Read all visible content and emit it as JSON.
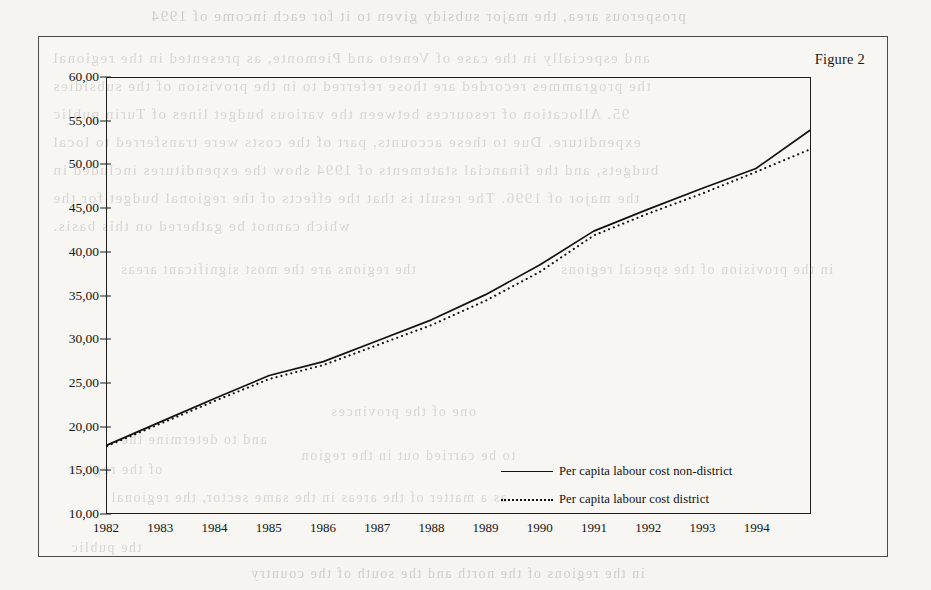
{
  "figure": {
    "caption": "Figure 2"
  },
  "bleed_text": [
    {
      "text": "prosperous area, the major subsidy given to it for each income of 1994",
      "x": 150,
      "y": 8,
      "size": 15
    },
    {
      "text": "and especially in the case of Veneto and Piemonte, as presented in the regional",
      "x": 52,
      "y": 50,
      "size": 15
    },
    {
      "text": "the programmes recorded are those referred to in the provision of the subsidies",
      "x": 52,
      "y": 78,
      "size": 15
    },
    {
      "text": "95. Allocation of resources between the various budget lines of Turin public",
      "x": 52,
      "y": 106,
      "size": 15
    },
    {
      "text": "expenditure. Due to these accounts, part of the costs were transferred to local",
      "x": 52,
      "y": 134,
      "size": 15
    },
    {
      "text": "budgets, and the financial statements of 1994 show the expenditures included in",
      "x": 52,
      "y": 162,
      "size": 15
    },
    {
      "text": "the major of 1996. The result is that the effects of the regional budget for the",
      "x": 52,
      "y": 190,
      "size": 15
    },
    {
      "text": "which cannot be gathered on this basis.",
      "x": 52,
      "y": 218,
      "size": 15
    },
    {
      "text": "the regions are the most significant areas",
      "x": 120,
      "y": 262,
      "size": 14
    },
    {
      "text": "in the provision of the special regions",
      "x": 560,
      "y": 262,
      "size": 14
    },
    {
      "text": "one of the provinces",
      "x": 330,
      "y": 404,
      "size": 14
    },
    {
      "text": "and to determine the",
      "x": 120,
      "y": 432,
      "size": 14
    },
    {
      "text": "to be carried out in the region",
      "x": 300,
      "y": 448,
      "size": 14
    },
    {
      "text": "of the region",
      "x": 70,
      "y": 462,
      "size": 14
    },
    {
      "text": "as a matter of the areas in the same sector, the regional",
      "x": 110,
      "y": 490,
      "size": 14
    },
    {
      "text": "the public",
      "x": 70,
      "y": 540,
      "size": 14
    },
    {
      "text": "in the regions of the north and the south of the country",
      "x": 250,
      "y": 566,
      "size": 14
    }
  ],
  "chart_data": {
    "type": "line",
    "title": "Figure 2",
    "xlabel": "",
    "ylabel": "",
    "grid": false,
    "legend_position": "center-bottom-inside",
    "xlim": [
      1982,
      1995
    ],
    "ylim": [
      10.0,
      60.0
    ],
    "ytick_step": 5.0,
    "ytick_labels": [
      "60,00",
      "55,00",
      "50,00",
      "45,00",
      "40,00",
      "35,00",
      "30,00",
      "25,00",
      "20,00",
      "15,00",
      "10,00"
    ],
    "ytick_values": [
      60.0,
      55.0,
      50.0,
      45.0,
      40.0,
      35.0,
      30.0,
      25.0,
      20.0,
      15.0,
      10.0
    ],
    "xtick_labels": [
      "1982",
      "1983",
      "1984",
      "1985",
      "1986",
      "1987",
      "1988",
      "1989",
      "1990",
      "1991",
      "1992",
      "1993",
      "1994"
    ],
    "xtick_values": [
      1982,
      1983,
      1984,
      1985,
      1986,
      1987,
      1988,
      1989,
      1990,
      1991,
      1992,
      1993,
      1994
    ],
    "x": [
      1982,
      1983,
      1984,
      1985,
      1986,
      1987,
      1988,
      1989,
      1990,
      1991,
      1992,
      1993,
      1994,
      1995
    ],
    "series": [
      {
        "name": "Per capita labour cost non-district",
        "style": "solid",
        "color": "#111111",
        "values": [
          17.8,
          20.5,
          23.2,
          25.8,
          27.4,
          29.8,
          32.2,
          35.1,
          38.5,
          42.4,
          44.9,
          47.3,
          49.6,
          54.0
        ]
      },
      {
        "name": "Per capita labour cost district",
        "style": "dotted",
        "color": "#111111",
        "values": [
          17.7,
          20.3,
          22.9,
          25.4,
          27.0,
          29.3,
          31.6,
          34.4,
          37.7,
          41.9,
          44.4,
          46.7,
          49.2,
          51.8
        ]
      }
    ]
  },
  "legend": {
    "items": [
      {
        "label": "Per capita labour cost non-district",
        "style": "solid"
      },
      {
        "label": "Per capita labour cost district",
        "style": "dotted"
      }
    ]
  }
}
